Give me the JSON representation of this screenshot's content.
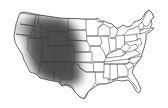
{
  "map": {
    "title": "United States (contiguous) with shaded western region",
    "background_color": "#ffffff",
    "border_color": "#3a3a3a",
    "shade_color": "#555555",
    "highlighted_region": {
      "label": "Western / Mountain states",
      "states": [
        "Washington (east)",
        "Oregon (east)",
        "Idaho",
        "Montana (west)",
        "Wyoming",
        "Nevada",
        "Utah",
        "Colorado",
        "Arizona",
        "New Mexico",
        "California (east)",
        "Texas (far west)"
      ],
      "style": "soft-edged gray gradient"
    }
  }
}
